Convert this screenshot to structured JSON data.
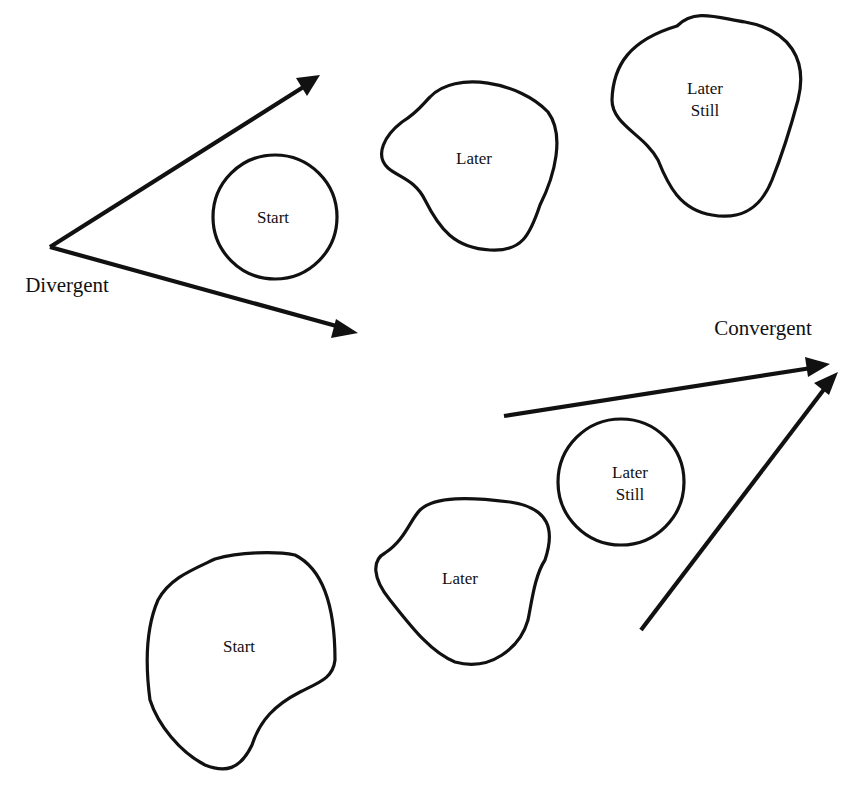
{
  "diagram": {
    "colors": {
      "ink": "#111111",
      "background": "#ffffff"
    },
    "divergent": {
      "label": "Divergent",
      "stages": [
        {
          "id": "div-start",
          "label_lines": [
            "Start"
          ],
          "shape": "circle",
          "relative_size": "small"
        },
        {
          "id": "div-later",
          "label_lines": [
            "Later"
          ],
          "shape": "blob",
          "relative_size": "medium"
        },
        {
          "id": "div-later-still",
          "label_lines": [
            "Later",
            "Still"
          ],
          "shape": "blob",
          "relative_size": "large"
        }
      ],
      "arrows": {
        "count": 2,
        "direction": "spreading outward (left to right)"
      }
    },
    "convergent": {
      "label": "Convergent",
      "stages": [
        {
          "id": "con-start",
          "label_lines": [
            "Start"
          ],
          "shape": "blob",
          "relative_size": "large"
        },
        {
          "id": "con-later",
          "label_lines": [
            "Later"
          ],
          "shape": "blob",
          "relative_size": "medium"
        },
        {
          "id": "con-later-still",
          "label_lines": [
            "Later",
            "Still"
          ],
          "shape": "circle",
          "relative_size": "small"
        }
      ],
      "arrows": {
        "count": 2,
        "direction": "meeting at a point (upper right)"
      }
    }
  }
}
